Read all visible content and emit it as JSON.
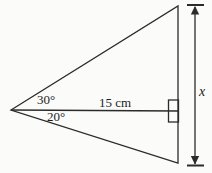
{
  "diagram": {
    "type": "geometry-triangle-figure",
    "labels": {
      "angle_top": "30°",
      "angle_bottom": "20°",
      "base_length": "15 cm",
      "height_label": "x"
    },
    "shapes": {
      "triangle": "isosceles-like triangle with apex at left and vertical right side",
      "bisector": "horizontal line from apex to right side splitting apex angle into 30° above and 20° below",
      "right_angle_marker": "square marker where horizontal line meets vertical side",
      "dimension_arrow": "vertical double-headed arrow with end ticks measuring right side as x"
    },
    "colors": {
      "background": "#fbfbf9",
      "line": "#2b2b2b",
      "text": "#1d1d1d"
    }
  }
}
